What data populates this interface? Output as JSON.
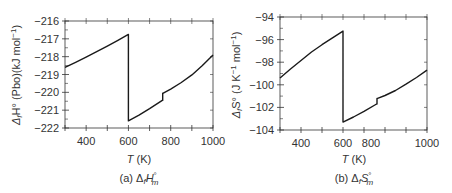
{
  "chart_data": [
    {
      "type": "line",
      "panel": "a",
      "caption": "(a) ΔfH°m",
      "caption_parts": {
        "prefix": "(a)",
        "symbol": "Δ",
        "sub": "f",
        "main": "H",
        "sup": "°",
        "subm": "m"
      },
      "xlabel": "T (K)",
      "ylabel": "ΔfH° (Pbo)(kJ mol⁻¹)",
      "xlim": [
        300,
        1000
      ],
      "ylim": [
        -222,
        -216
      ],
      "xticks": [
        400,
        600,
        800,
        1000
      ],
      "xminor": [
        300,
        400,
        500,
        600,
        700,
        800,
        900,
        1000
      ],
      "yticks": [
        -216,
        -217,
        -218,
        -219,
        -220,
        -221,
        -222
      ],
      "grid": false,
      "series": [
        {
          "name": "segment-1",
          "x": [
            300,
            350,
            400,
            450,
            500,
            550,
            600
          ],
          "y": [
            -218.6,
            -218.32,
            -218.03,
            -217.72,
            -217.41,
            -217.08,
            -216.75
          ]
        },
        {
          "name": "segment-2",
          "x": [
            600,
            650,
            700,
            760
          ],
          "y": [
            -221.6,
            -221.28,
            -220.92,
            -220.45
          ]
        },
        {
          "name": "segment-3",
          "x": [
            765,
            800,
            850,
            900,
            950,
            1000
          ],
          "y": [
            -220.05,
            -219.82,
            -219.45,
            -219.02,
            -218.5,
            -217.9
          ]
        }
      ],
      "jumps": [
        {
          "x": 600,
          "from": -216.75,
          "to": -221.6
        },
        {
          "x": 762,
          "from": -220.45,
          "to": -220.05
        }
      ]
    },
    {
      "type": "line",
      "panel": "b",
      "caption": "(b) ΔfS°m",
      "caption_parts": {
        "prefix": "(b)",
        "symbol": "Δ",
        "sub": "f",
        "main": "S",
        "sup": "°",
        "subm": "m"
      },
      "xlabel": "T (K)",
      "ylabel": "ΔfS° (J K⁻¹ mol⁻¹)",
      "xlim": [
        300,
        1000
      ],
      "ylim": [
        -104,
        -94
      ],
      "xticks": [
        400,
        600,
        800,
        1000
      ],
      "xminor": [
        300,
        400,
        500,
        600,
        700,
        800,
        900,
        1000
      ],
      "yticks": [
        -94,
        -96,
        -98,
        -100,
        -102,
        -104
      ],
      "grid": false,
      "series": [
        {
          "name": "segment-1",
          "x": [
            300,
            350,
            400,
            450,
            500,
            550,
            600
          ],
          "y": [
            -99.4,
            -98.6,
            -97.85,
            -97.1,
            -96.45,
            -95.85,
            -95.25
          ]
        },
        {
          "name": "segment-2",
          "x": [
            600,
            650,
            700,
            760
          ],
          "y": [
            -103.3,
            -102.85,
            -102.35,
            -101.7
          ]
        },
        {
          "name": "segment-3",
          "x": [
            765,
            800,
            850,
            900,
            950,
            1000
          ],
          "y": [
            -101.2,
            -100.95,
            -100.5,
            -99.95,
            -99.35,
            -98.7
          ]
        }
      ],
      "jumps": [
        {
          "x": 600,
          "from": -95.25,
          "to": -103.3
        },
        {
          "x": 762,
          "from": -101.7,
          "to": -101.2
        }
      ]
    }
  ],
  "labels": {
    "a": {
      "ylabel_main": "Δ",
      "ylabel_sub": "f",
      "ylabel_rest": "H° (Pbo)(kJ mol",
      "ylabel_sup": "−1",
      "ylabel_end": ")",
      "xlabel_italic": "T",
      "xlabel_rest": " (K)",
      "cap_prefix": "(a) ",
      "cap_delta": "Δ",
      "cap_sub": "f",
      "cap_main": "H",
      "cap_sup": "°",
      "cap_subm": "m"
    },
    "b": {
      "ylabel_main": "Δ",
      "ylabel_sub": "f",
      "ylabel_rest": "S° (J K",
      "ylabel_sup1": "−1",
      "ylabel_mid": " mol",
      "ylabel_sup2": "−1",
      "ylabel_end": ")",
      "xlabel_italic": "T",
      "xlabel_rest": " (K)",
      "cap_prefix": "(b) ",
      "cap_delta": "Δ",
      "cap_sub": "f",
      "cap_main": "S",
      "cap_sup": "°",
      "cap_subm": "m"
    }
  },
  "colors": {
    "line": "#1a1a1a",
    "axis": "#333333",
    "text": "#333333"
  }
}
